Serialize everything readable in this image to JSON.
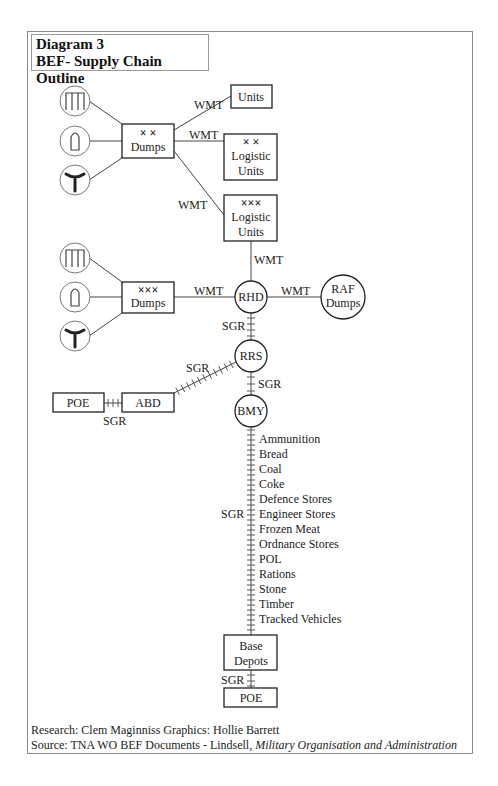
{
  "title": {
    "line1": "Diagram 3",
    "line2": "BEF- Supply Chain Outline"
  },
  "nodes": {
    "units": "Units",
    "div_logistic_units": {
      "symbol": "× ×",
      "line1": "Logistic",
      "line2": "Units"
    },
    "corps_logistic_units": {
      "symbol": "×××",
      "line1": "Logistic",
      "line2": "Units"
    },
    "div_dumps": {
      "symbol": "× ×",
      "label": "Dumps"
    },
    "corps_dumps": {
      "symbol": "×××",
      "label": "Dumps"
    },
    "rhd": "RHD",
    "raf_dumps": {
      "line1": "RAF",
      "line2": "Dumps"
    },
    "rrs": "RRS",
    "bmy": "BMY",
    "abd": "ABD",
    "poe_left": "POE",
    "base_depots": {
      "line1": "Base",
      "line2": "Depots"
    },
    "poe_bottom": "POE"
  },
  "edge_labels": {
    "wmt": "WMT",
    "sgr": "SGR"
  },
  "commodities": [
    "Ammunition",
    "Bread",
    "Coal",
    "Coke",
    "Defence Stores",
    "Engineer Stores",
    "Frozen Meat",
    "Ordnance Stores",
    "POL",
    "Rations",
    "Stone",
    "Timber",
    "Tracked Vehicles"
  ],
  "icons": [
    "depot-building-icon",
    "shell-icon",
    "fork-icon"
  ],
  "credits": {
    "line1": "Research: Clem Maginniss  Graphics: Hollie Barrett",
    "line2_prefix": "Source: TNA WO BEF Documents - Lindsell, ",
    "line2_italic": "Military Organisation and Administration"
  }
}
